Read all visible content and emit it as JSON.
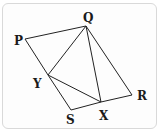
{
  "diagram": {
    "type": "geometry-figure",
    "points": [
      {
        "name": "P",
        "x": 25,
        "y": 39,
        "label_x": 14,
        "label_y": 45
      },
      {
        "name": "Q",
        "x": 86,
        "y": 26,
        "label_x": 83,
        "label_y": 22
      },
      {
        "name": "R",
        "x": 132,
        "y": 95,
        "label_x": 137,
        "label_y": 100
      },
      {
        "name": "S",
        "x": 71,
        "y": 110,
        "label_x": 66,
        "label_y": 124
      },
      {
        "name": "Y",
        "x": 48,
        "y": 75,
        "label_x": 33,
        "label_y": 88
      },
      {
        "name": "X",
        "x": 101,
        "y": 102,
        "label_x": 99,
        "label_y": 120
      }
    ],
    "segments": [
      [
        "P",
        "Q"
      ],
      [
        "Q",
        "R"
      ],
      [
        "R",
        "X"
      ],
      [
        "X",
        "S"
      ],
      [
        "S",
        "Y"
      ],
      [
        "Y",
        "P"
      ],
      [
        "Q",
        "Y"
      ],
      [
        "Q",
        "X"
      ],
      [
        "Y",
        "X"
      ]
    ],
    "line_color": "#222222"
  }
}
